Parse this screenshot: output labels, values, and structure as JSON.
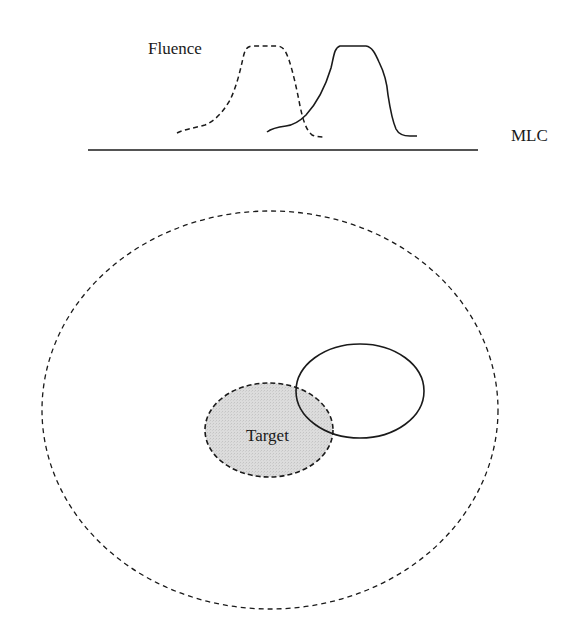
{
  "diagram": {
    "labels": {
      "fluence": "Fluence",
      "mlc": "MLC",
      "target": "Target"
    },
    "colors": {
      "stroke": "#1a1a1a",
      "target_fill": "#d9d9d9",
      "background": "#ffffff"
    },
    "elements": {
      "mlc_line": {
        "x1": 88,
        "y1": 150,
        "x2": 478,
        "y2": 150,
        "style": "solid"
      },
      "fluence_profile_dashed": {
        "style": "dashed",
        "plateau_x": [
          249,
          280
        ],
        "plateau_y": 46,
        "baseline_y": 135
      },
      "fluence_profile_solid": {
        "style": "solid",
        "plateau_x": [
          337,
          370
        ],
        "plateau_y": 46,
        "baseline_y": 136
      },
      "outer_contour": {
        "cx": 270,
        "cy": 410,
        "rx": 228,
        "ry": 199,
        "style": "dashed"
      },
      "target_volume": {
        "cx": 269,
        "cy": 430,
        "rx": 64,
        "ry": 47,
        "style": "dashed",
        "filled": true
      },
      "shifted_volume": {
        "cx": 360,
        "cy": 391,
        "rx": 64,
        "ry": 47,
        "style": "solid",
        "filled": false
      }
    }
  }
}
